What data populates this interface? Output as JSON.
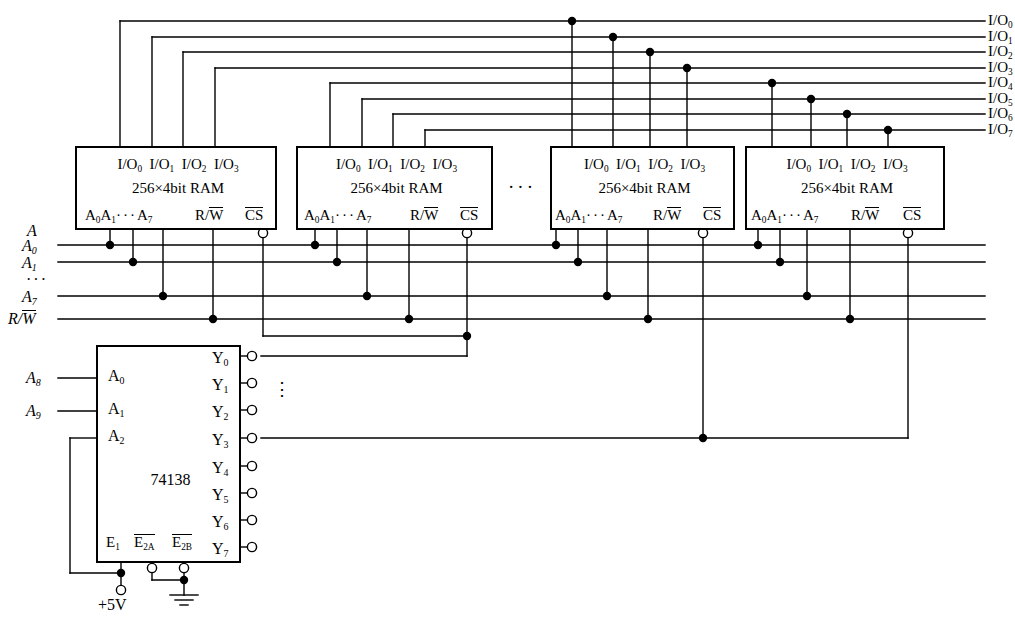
{
  "diagram": {
    "line_color": "#000000",
    "background": "#ffffff"
  },
  "io_bus": {
    "labels": [
      "I/O0",
      "I/O1",
      "I/O2",
      "I/O3",
      "I/O4",
      "I/O5",
      "I/O6",
      "I/O7"
    ],
    "base": "I/O",
    "indices": [
      "0",
      "1",
      "2",
      "3",
      "4",
      "5",
      "6",
      "7"
    ]
  },
  "address_bus": {
    "group_label": "A",
    "labels": [
      "A0",
      "A1",
      "...",
      "A7"
    ],
    "ellipsis": "···",
    "rw_label": "R/W"
  },
  "ram_blocks": [
    {
      "id": "ram-1",
      "io_pins": [
        "I/O0",
        "I/O1",
        "I/O2",
        "I/O3"
      ],
      "type": "256×4bit  RAM",
      "addr_pins": "A0A1···A7",
      "rw_pin": "R/W",
      "cs_pin": "CS"
    },
    {
      "id": "ram-2",
      "io_pins": [
        "I/O0",
        "I/O1",
        "I/O2",
        "I/O3"
      ],
      "type": "256×4bit  RAM",
      "addr_pins": "A0A1···A7",
      "rw_pin": "R/W",
      "cs_pin": "CS"
    },
    {
      "id": "ram-3",
      "io_pins": [
        "I/O0",
        "I/O1",
        "I/O2",
        "I/O3"
      ],
      "type": "256×4bit  RAM",
      "addr_pins": "A0A1···A7",
      "rw_pin": "R/W",
      "cs_pin": "CS"
    },
    {
      "id": "ram-4",
      "io_pins": [
        "I/O0",
        "I/O1",
        "I/O2",
        "I/O3"
      ],
      "type": "256×4bit  RAM",
      "addr_pins": "A0A1···A7",
      "rw_pin": "R/W",
      "cs_pin": "CS"
    }
  ],
  "ram_ellipsis": "···",
  "decoder": {
    "part_number": "74138",
    "inputs": [
      "A0",
      "A1",
      "A2"
    ],
    "input_signals": [
      "A8",
      "A9"
    ],
    "enables": [
      "E1",
      "E2A",
      "E2B"
    ],
    "outputs": [
      "Y0",
      "Y1",
      "Y2",
      "Y3",
      "Y4",
      "Y5",
      "Y6",
      "Y7"
    ],
    "output_ellipsis": "⋮"
  },
  "power": {
    "supply_label": "+5V",
    "ground_label": ""
  }
}
